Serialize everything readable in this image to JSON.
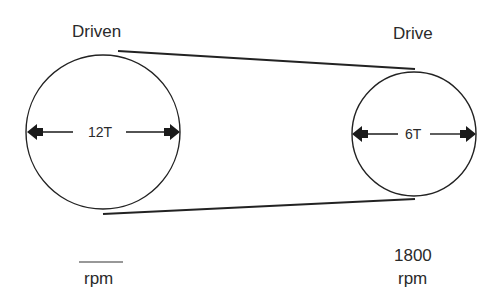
{
  "diagram": {
    "type": "belt-drive-pulleys",
    "driven": {
      "title": "Driven",
      "teeth_label": "12T",
      "speed_value": "",
      "speed_blank": "____",
      "speed_unit": "rpm"
    },
    "drive": {
      "title": "Drive",
      "teeth_label": "6T",
      "speed_value": "1800",
      "speed_unit": "rpm"
    },
    "colors": {
      "stroke": "#222222",
      "background": "#ffffff"
    }
  }
}
